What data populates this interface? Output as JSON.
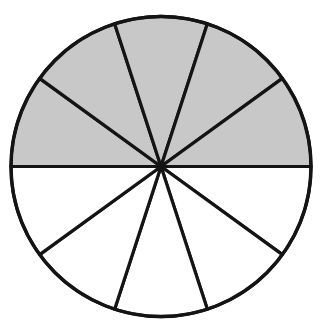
{
  "figure": {
    "kind": "fraction-circle-diagram",
    "title": "",
    "caption": "",
    "background_color": "#ffffff"
  },
  "geometry": {
    "center_x": 161,
    "center_y": 166.5,
    "radius": 150,
    "stroke_color": "#141414",
    "stroke_width": 3.2,
    "outline_stroke_width": 3.4,
    "start_angle_deg": 180,
    "sector_count": 10,
    "sector_angle_deg": 36
  },
  "colors": {
    "shaded_fill": "#c8c8c8",
    "unshaded_fill": "#ffffff",
    "line": "#141414"
  },
  "chart_data": {
    "type": "pie",
    "title": "",
    "subtitle": "",
    "xlabel": "",
    "ylabel": "",
    "legend_position": "none",
    "grid": false,
    "total_sectors": 10,
    "shaded_sectors": 5,
    "unshaded_sectors": 5,
    "fraction_shaded": "5/10",
    "percent_shaded": 50,
    "categories": [
      "sector-1",
      "sector-2",
      "sector-3",
      "sector-4",
      "sector-5",
      "sector-6",
      "sector-7",
      "sector-8",
      "sector-9",
      "sector-10"
    ],
    "values": [
      10,
      10,
      10,
      10,
      10,
      10,
      10,
      10,
      10,
      10
    ],
    "series": [
      {
        "name": "sectors",
        "values": [
          10,
          10,
          10,
          10,
          10,
          10,
          10,
          10,
          10,
          10
        ]
      }
    ],
    "sectors": [
      {
        "index": 1,
        "start_deg": 180,
        "end_deg": 216,
        "shaded": true,
        "fill": "#c8c8c8"
      },
      {
        "index": 2,
        "start_deg": 216,
        "end_deg": 252,
        "shaded": true,
        "fill": "#c8c8c8"
      },
      {
        "index": 3,
        "start_deg": 252,
        "end_deg": 288,
        "shaded": true,
        "fill": "#c8c8c8"
      },
      {
        "index": 4,
        "start_deg": 288,
        "end_deg": 324,
        "shaded": true,
        "fill": "#c8c8c8"
      },
      {
        "index": 5,
        "start_deg": 324,
        "end_deg": 360,
        "shaded": true,
        "fill": "#c8c8c8"
      },
      {
        "index": 6,
        "start_deg": 0,
        "end_deg": 36,
        "shaded": false,
        "fill": "#ffffff"
      },
      {
        "index": 7,
        "start_deg": 36,
        "end_deg": 72,
        "shaded": false,
        "fill": "#ffffff"
      },
      {
        "index": 8,
        "start_deg": 72,
        "end_deg": 108,
        "shaded": false,
        "fill": "#ffffff"
      },
      {
        "index": 9,
        "start_deg": 108,
        "end_deg": 144,
        "shaded": false,
        "fill": "#ffffff"
      },
      {
        "index": 10,
        "start_deg": 144,
        "end_deg": 180,
        "shaded": false,
        "fill": "#ffffff"
      }
    ]
  }
}
